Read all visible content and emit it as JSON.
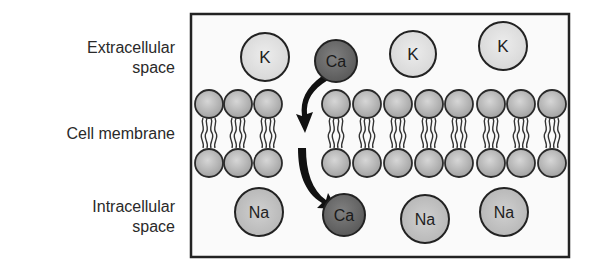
{
  "labels": {
    "extracellular_line1": "Extracellular",
    "extracellular_line2": "space",
    "membrane": "Cell membrane",
    "intracellular_line1": "Intracellular",
    "intracellular_line2": "space"
  },
  "ions": {
    "top": [
      {
        "symbol": "K",
        "type": "potassium"
      },
      {
        "symbol": "Ca",
        "type": "calcium"
      },
      {
        "symbol": "K",
        "type": "potassium"
      },
      {
        "symbol": "K",
        "type": "potassium"
      }
    ],
    "bottom": [
      {
        "symbol": "Na",
        "type": "sodium"
      },
      {
        "symbol": "Ca",
        "type": "calcium"
      },
      {
        "symbol": "Na",
        "type": "sodium"
      },
      {
        "symbol": "Na",
        "type": "sodium"
      }
    ]
  },
  "colors": {
    "potassium_fill": "#e4e4e4",
    "sodium_fill": "#c9c9c9",
    "calcium_fill": "#6e6e6e",
    "head_fill": "#b5b5b5",
    "outline": "#222222",
    "arrow": "#111111"
  }
}
